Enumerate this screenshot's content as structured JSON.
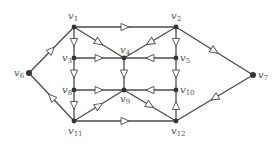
{
  "diagram": {
    "type": "directed-graph",
    "colors": {
      "edge": "#4a4a4a",
      "node": "#333333",
      "label": "#555555",
      "arrow_fill": "#ffffff"
    },
    "nodes": [
      {
        "id": "v1",
        "label": "v",
        "sub": "1",
        "x": 74,
        "y": 27,
        "lx": 68,
        "ly": 19,
        "anchor": "start"
      },
      {
        "id": "v2",
        "label": "v",
        "sub": "2",
        "x": 176,
        "y": 27,
        "lx": 171,
        "ly": 19,
        "anchor": "start"
      },
      {
        "id": "v3",
        "label": "v",
        "sub": "3",
        "x": 74,
        "y": 58,
        "lx": 62,
        "ly": 61,
        "anchor": "start"
      },
      {
        "id": "v4",
        "label": "v",
        "sub": "4",
        "x": 124,
        "y": 58,
        "lx": 120,
        "ly": 53,
        "anchor": "start"
      },
      {
        "id": "v5",
        "label": "v",
        "sub": "5",
        "x": 176,
        "y": 58,
        "lx": 180,
        "ly": 61,
        "anchor": "start"
      },
      {
        "id": "v6",
        "label": "v",
        "sub": "6",
        "x": 29,
        "y": 73,
        "lx": 14,
        "ly": 76,
        "anchor": "start"
      },
      {
        "id": "v7",
        "label": "v",
        "sub": "7",
        "x": 253,
        "y": 75,
        "lx": 258,
        "ly": 78,
        "anchor": "start"
      },
      {
        "id": "v8",
        "label": "v",
        "sub": "8",
        "x": 74,
        "y": 90,
        "lx": 62,
        "ly": 93,
        "anchor": "start"
      },
      {
        "id": "v9",
        "label": "v",
        "sub": "9",
        "x": 124,
        "y": 90,
        "lx": 120,
        "ly": 102,
        "anchor": "start"
      },
      {
        "id": "v10",
        "label": "v",
        "sub": "10",
        "x": 176,
        "y": 90,
        "lx": 180,
        "ly": 93,
        "anchor": "start"
      },
      {
        "id": "v11",
        "label": "v",
        "sub": "11",
        "x": 74,
        "y": 121,
        "lx": 68,
        "ly": 134,
        "anchor": "start"
      },
      {
        "id": "v12",
        "label": "v",
        "sub": "12",
        "x": 176,
        "y": 121,
        "lx": 171,
        "ly": 134,
        "anchor": "start"
      }
    ],
    "edges": [
      {
        "from": "v1",
        "to": "v2"
      },
      {
        "from": "v1",
        "to": "v4"
      },
      {
        "from": "v2",
        "to": "v4"
      },
      {
        "from": "v1",
        "to": "v3"
      },
      {
        "from": "v3",
        "to": "v8"
      },
      {
        "from": "v8",
        "to": "v11"
      },
      {
        "from": "v3",
        "to": "v4"
      },
      {
        "from": "v5",
        "to": "v4"
      },
      {
        "from": "v2",
        "to": "v5"
      },
      {
        "from": "v5",
        "to": "v10"
      },
      {
        "from": "v12",
        "to": "v10"
      },
      {
        "from": "v4",
        "to": "v9"
      },
      {
        "from": "v8",
        "to": "v9"
      },
      {
        "from": "v10",
        "to": "v9"
      },
      {
        "from": "v11",
        "to": "v9"
      },
      {
        "from": "v9",
        "to": "v12"
      },
      {
        "from": "v11",
        "to": "v12"
      },
      {
        "from": "v6",
        "to": "v1"
      },
      {
        "from": "v11",
        "to": "v6"
      },
      {
        "from": "v2",
        "to": "v7"
      },
      {
        "from": "v7",
        "to": "v12"
      }
    ]
  }
}
